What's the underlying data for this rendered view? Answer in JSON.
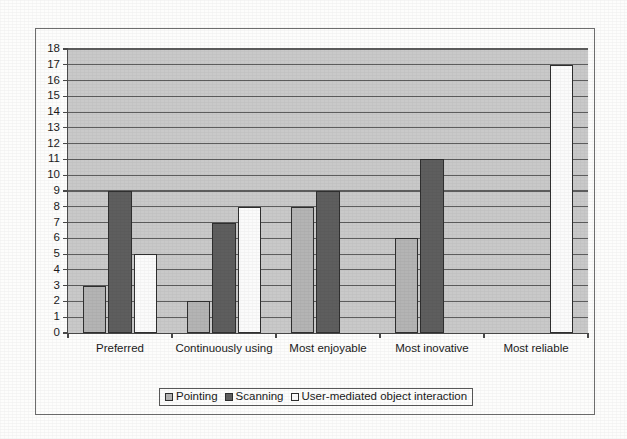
{
  "chart_data": {
    "type": "bar",
    "title": "",
    "subtitle": "",
    "xlabel": "",
    "ylabel": "",
    "ylim": [
      0,
      18
    ],
    "ytick_step": 1,
    "yticks": [
      0,
      1,
      2,
      3,
      4,
      5,
      6,
      7,
      8,
      9,
      10,
      11,
      12,
      13,
      14,
      15,
      16,
      17,
      18
    ],
    "grid": true,
    "grid_axis": "y",
    "legend_position": "bottom-center",
    "categories": [
      "Preferred",
      "Continuously using",
      "Most enjoyable",
      "Most inovative",
      "Most reliable"
    ],
    "series": [
      {
        "name": "Pointing",
        "color": "#b4b4b4",
        "values": [
          3,
          2,
          8,
          6,
          null
        ]
      },
      {
        "name": "Scanning",
        "color": "#5e5e5e",
        "values": [
          9,
          7,
          9,
          11,
          null
        ]
      },
      {
        "name": "User-mediated object interaction",
        "color": "#fbfbfb",
        "values": [
          5,
          8,
          null,
          null,
          17
        ]
      }
    ],
    "plot_background": "#c9c9c9",
    "gridline_color": "#5d5d5d",
    "axis_color": "#4a4a4a",
    "bar_border_color": "#2f2f2f"
  },
  "legend": {
    "items": [
      {
        "label": "Pointing",
        "swatch": "pointing"
      },
      {
        "label": "Scanning",
        "swatch": "scanning"
      },
      {
        "label": "User-mediated object interaction",
        "swatch": "user-mediated"
      }
    ]
  }
}
